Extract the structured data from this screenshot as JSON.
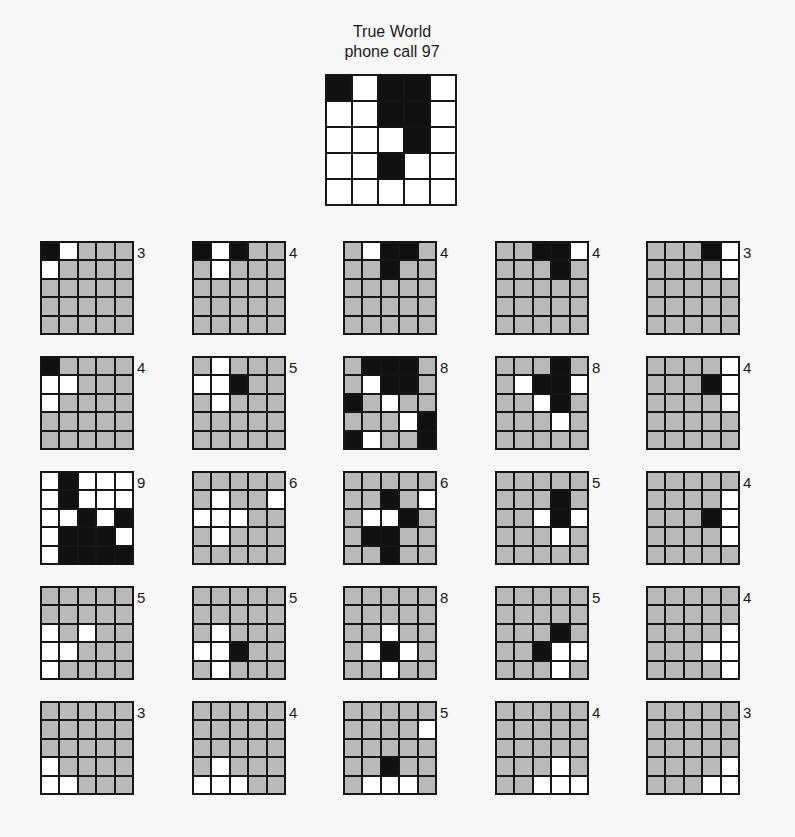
{
  "title": {
    "line1": "True World",
    "line2": "phone call 97"
  },
  "colors": {
    "occupied": "#111111",
    "free": "#ffffff",
    "unknown": "#b9b9b9",
    "gridline": "#161616"
  },
  "true_world": {
    "rows": [
      [
        "B",
        "W",
        "B",
        "B",
        "W"
      ],
      [
        "W",
        "W",
        "B",
        "B",
        "W"
      ],
      [
        "W",
        "W",
        "W",
        "B",
        "W"
      ],
      [
        "W",
        "W",
        "B",
        "W",
        "W"
      ],
      [
        "W",
        "W",
        "W",
        "W",
        "W"
      ]
    ]
  },
  "grids": [
    {
      "label": "3",
      "rows": [
        [
          "B",
          "W",
          "G",
          "G",
          "G"
        ],
        [
          "W",
          "G",
          "G",
          "G",
          "G"
        ],
        [
          "G",
          "G",
          "G",
          "G",
          "G"
        ],
        [
          "G",
          "G",
          "G",
          "G",
          "G"
        ],
        [
          "G",
          "G",
          "G",
          "G",
          "G"
        ]
      ]
    },
    {
      "label": "4",
      "rows": [
        [
          "B",
          "W",
          "B",
          "G",
          "G"
        ],
        [
          "G",
          "W",
          "G",
          "G",
          "G"
        ],
        [
          "G",
          "G",
          "G",
          "G",
          "G"
        ],
        [
          "G",
          "G",
          "G",
          "G",
          "G"
        ],
        [
          "G",
          "G",
          "G",
          "G",
          "G"
        ]
      ]
    },
    {
      "label": "4",
      "rows": [
        [
          "G",
          "W",
          "B",
          "B",
          "G"
        ],
        [
          "G",
          "G",
          "B",
          "G",
          "G"
        ],
        [
          "G",
          "G",
          "G",
          "G",
          "G"
        ],
        [
          "G",
          "G",
          "G",
          "G",
          "G"
        ],
        [
          "G",
          "G",
          "G",
          "G",
          "G"
        ]
      ]
    },
    {
      "label": "4",
      "rows": [
        [
          "G",
          "G",
          "B",
          "B",
          "W"
        ],
        [
          "G",
          "G",
          "G",
          "B",
          "G"
        ],
        [
          "G",
          "G",
          "G",
          "G",
          "G"
        ],
        [
          "G",
          "G",
          "G",
          "G",
          "G"
        ],
        [
          "G",
          "G",
          "G",
          "G",
          "G"
        ]
      ]
    },
    {
      "label": "3",
      "rows": [
        [
          "G",
          "G",
          "G",
          "B",
          "W"
        ],
        [
          "G",
          "G",
          "G",
          "G",
          "W"
        ],
        [
          "G",
          "G",
          "G",
          "G",
          "G"
        ],
        [
          "G",
          "G",
          "G",
          "G",
          "G"
        ],
        [
          "G",
          "G",
          "G",
          "G",
          "G"
        ]
      ]
    },
    {
      "label": "4",
      "rows": [
        [
          "B",
          "G",
          "G",
          "G",
          "G"
        ],
        [
          "W",
          "W",
          "G",
          "G",
          "G"
        ],
        [
          "W",
          "G",
          "G",
          "G",
          "G"
        ],
        [
          "G",
          "G",
          "G",
          "G",
          "G"
        ],
        [
          "G",
          "G",
          "G",
          "G",
          "G"
        ]
      ]
    },
    {
      "label": "5",
      "rows": [
        [
          "G",
          "W",
          "G",
          "G",
          "G"
        ],
        [
          "W",
          "W",
          "B",
          "G",
          "G"
        ],
        [
          "G",
          "W",
          "G",
          "G",
          "G"
        ],
        [
          "G",
          "G",
          "G",
          "G",
          "G"
        ],
        [
          "G",
          "G",
          "G",
          "G",
          "G"
        ]
      ]
    },
    {
      "label": "8",
      "rows": [
        [
          "G",
          "B",
          "B",
          "B",
          "G"
        ],
        [
          "G",
          "W",
          "B",
          "B",
          "G"
        ],
        [
          "B",
          "G",
          "W",
          "G",
          "G"
        ],
        [
          "G",
          "G",
          "G",
          "W",
          "B"
        ],
        [
          "B",
          "W",
          "G",
          "G",
          "B"
        ]
      ]
    },
    {
      "label": "8",
      "rows": [
        [
          "G",
          "G",
          "G",
          "B",
          "G"
        ],
        [
          "G",
          "W",
          "B",
          "B",
          "W"
        ],
        [
          "G",
          "G",
          "W",
          "B",
          "G"
        ],
        [
          "G",
          "G",
          "G",
          "W",
          "G"
        ],
        [
          "G",
          "G",
          "G",
          "G",
          "G"
        ]
      ]
    },
    {
      "label": "4",
      "rows": [
        [
          "G",
          "G",
          "G",
          "G",
          "W"
        ],
        [
          "G",
          "G",
          "G",
          "B",
          "W"
        ],
        [
          "G",
          "G",
          "G",
          "G",
          "W"
        ],
        [
          "G",
          "G",
          "G",
          "G",
          "G"
        ],
        [
          "G",
          "G",
          "G",
          "G",
          "G"
        ]
      ]
    },
    {
      "label": "9",
      "rows": [
        [
          "W",
          "B",
          "W",
          "W",
          "W"
        ],
        [
          "W",
          "B",
          "W",
          "W",
          "W"
        ],
        [
          "W",
          "W",
          "B",
          "W",
          "B"
        ],
        [
          "W",
          "B",
          "B",
          "B",
          "W"
        ],
        [
          "W",
          "B",
          "B",
          "B",
          "B"
        ]
      ]
    },
    {
      "label": "6",
      "rows": [
        [
          "G",
          "G",
          "G",
          "G",
          "G"
        ],
        [
          "G",
          "W",
          "G",
          "G",
          "W"
        ],
        [
          "W",
          "W",
          "W",
          "G",
          "G"
        ],
        [
          "G",
          "W",
          "G",
          "G",
          "G"
        ],
        [
          "G",
          "G",
          "G",
          "G",
          "G"
        ]
      ]
    },
    {
      "label": "6",
      "rows": [
        [
          "G",
          "G",
          "G",
          "G",
          "G"
        ],
        [
          "G",
          "G",
          "B",
          "G",
          "W"
        ],
        [
          "G",
          "W",
          "W",
          "B",
          "G"
        ],
        [
          "G",
          "B",
          "B",
          "G",
          "G"
        ],
        [
          "G",
          "G",
          "B",
          "G",
          "G"
        ]
      ]
    },
    {
      "label": "5",
      "rows": [
        [
          "G",
          "G",
          "G",
          "G",
          "G"
        ],
        [
          "G",
          "G",
          "G",
          "B",
          "G"
        ],
        [
          "G",
          "G",
          "W",
          "B",
          "W"
        ],
        [
          "G",
          "G",
          "G",
          "W",
          "G"
        ],
        [
          "G",
          "G",
          "G",
          "G",
          "G"
        ]
      ]
    },
    {
      "label": "4",
      "rows": [
        [
          "G",
          "G",
          "G",
          "G",
          "G"
        ],
        [
          "G",
          "G",
          "G",
          "G",
          "W"
        ],
        [
          "G",
          "G",
          "G",
          "B",
          "W"
        ],
        [
          "G",
          "G",
          "G",
          "G",
          "W"
        ],
        [
          "G",
          "G",
          "G",
          "G",
          "G"
        ]
      ]
    },
    {
      "label": "5",
      "rows": [
        [
          "G",
          "G",
          "G",
          "G",
          "G"
        ],
        [
          "G",
          "G",
          "G",
          "G",
          "G"
        ],
        [
          "W",
          "G",
          "W",
          "G",
          "G"
        ],
        [
          "W",
          "W",
          "G",
          "G",
          "G"
        ],
        [
          "W",
          "G",
          "G",
          "G",
          "G"
        ]
      ]
    },
    {
      "label": "5",
      "rows": [
        [
          "G",
          "G",
          "G",
          "G",
          "G"
        ],
        [
          "G",
          "G",
          "G",
          "G",
          "G"
        ],
        [
          "G",
          "W",
          "G",
          "G",
          "G"
        ],
        [
          "W",
          "W",
          "B",
          "G",
          "G"
        ],
        [
          "G",
          "W",
          "G",
          "G",
          "G"
        ]
      ]
    },
    {
      "label": "8",
      "rows": [
        [
          "G",
          "G",
          "G",
          "G",
          "G"
        ],
        [
          "G",
          "G",
          "G",
          "G",
          "G"
        ],
        [
          "G",
          "G",
          "W",
          "G",
          "G"
        ],
        [
          "G",
          "W",
          "B",
          "W",
          "G"
        ],
        [
          "G",
          "G",
          "W",
          "G",
          "G"
        ]
      ]
    },
    {
      "label": "5",
      "rows": [
        [
          "G",
          "G",
          "G",
          "G",
          "G"
        ],
        [
          "G",
          "G",
          "G",
          "G",
          "G"
        ],
        [
          "G",
          "G",
          "G",
          "B",
          "G"
        ],
        [
          "G",
          "G",
          "B",
          "W",
          "W"
        ],
        [
          "G",
          "G",
          "G",
          "W",
          "G"
        ]
      ]
    },
    {
      "label": "4",
      "rows": [
        [
          "G",
          "G",
          "G",
          "G",
          "G"
        ],
        [
          "G",
          "G",
          "G",
          "G",
          "G"
        ],
        [
          "G",
          "G",
          "G",
          "G",
          "W"
        ],
        [
          "G",
          "G",
          "G",
          "W",
          "W"
        ],
        [
          "G",
          "G",
          "G",
          "G",
          "W"
        ]
      ]
    },
    {
      "label": "3",
      "rows": [
        [
          "G",
          "G",
          "G",
          "G",
          "G"
        ],
        [
          "G",
          "G",
          "G",
          "G",
          "G"
        ],
        [
          "G",
          "G",
          "G",
          "G",
          "G"
        ],
        [
          "W",
          "G",
          "G",
          "G",
          "G"
        ],
        [
          "W",
          "W",
          "G",
          "G",
          "G"
        ]
      ]
    },
    {
      "label": "4",
      "rows": [
        [
          "G",
          "G",
          "G",
          "G",
          "G"
        ],
        [
          "G",
          "G",
          "G",
          "G",
          "G"
        ],
        [
          "G",
          "G",
          "G",
          "G",
          "G"
        ],
        [
          "G",
          "W",
          "G",
          "G",
          "G"
        ],
        [
          "W",
          "W",
          "W",
          "G",
          "G"
        ]
      ]
    },
    {
      "label": "5",
      "rows": [
        [
          "G",
          "G",
          "G",
          "G",
          "G"
        ],
        [
          "G",
          "G",
          "G",
          "G",
          "W"
        ],
        [
          "G",
          "G",
          "G",
          "G",
          "G"
        ],
        [
          "G",
          "G",
          "B",
          "G",
          "G"
        ],
        [
          "G",
          "W",
          "W",
          "W",
          "G"
        ]
      ]
    },
    {
      "label": "4",
      "rows": [
        [
          "G",
          "G",
          "G",
          "G",
          "G"
        ],
        [
          "G",
          "G",
          "G",
          "G",
          "G"
        ],
        [
          "G",
          "G",
          "G",
          "G",
          "G"
        ],
        [
          "G",
          "G",
          "G",
          "W",
          "G"
        ],
        [
          "G",
          "G",
          "W",
          "W",
          "W"
        ]
      ]
    },
    {
      "label": "3",
      "rows": [
        [
          "G",
          "G",
          "G",
          "G",
          "G"
        ],
        [
          "G",
          "G",
          "G",
          "G",
          "G"
        ],
        [
          "G",
          "G",
          "G",
          "G",
          "G"
        ],
        [
          "G",
          "G",
          "G",
          "G",
          "W"
        ],
        [
          "G",
          "G",
          "G",
          "W",
          "W"
        ]
      ]
    }
  ]
}
